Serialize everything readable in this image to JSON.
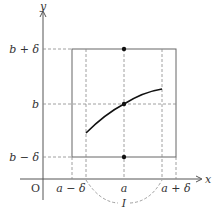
{
  "figure": {
    "type": "epsilon-delta neighborhood diagram",
    "axes": {
      "x_label": "x",
      "y_label": "y",
      "origin_label": "O"
    },
    "x_ticks": [
      {
        "id": "a_minus_delta",
        "label": "a − δ"
      },
      {
        "id": "a",
        "label": "a"
      },
      {
        "id": "a_plus_delta",
        "label": "a + δ"
      }
    ],
    "y_ticks": [
      {
        "id": "b_plus_delta",
        "label": "b + δ"
      },
      {
        "id": "b",
        "label": "b"
      },
      {
        "id": "b_minus_delta",
        "label": "b − δ"
      }
    ],
    "interval_label": "I",
    "points": [
      {
        "id": "top",
        "description": "(a, b+δ)"
      },
      {
        "id": "center",
        "description": "(a, b)"
      },
      {
        "id": "bottom",
        "description": "(a, b−δ)"
      }
    ],
    "curve": {
      "description": "increasing concave curve passing through (a, b) over interval I"
    }
  }
}
